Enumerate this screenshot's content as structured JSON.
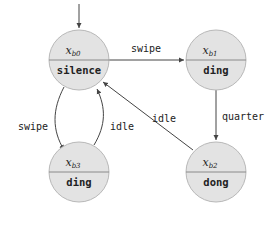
{
  "diagram": {
    "type": "state-machine",
    "initial_state": "xb0",
    "states": [
      {
        "id": "xb0",
        "var": "x",
        "sub": "b0",
        "output": "silence"
      },
      {
        "id": "xb1",
        "var": "x",
        "sub": "b1",
        "output": "ding"
      },
      {
        "id": "xb2",
        "var": "x",
        "sub": "b2",
        "output": "dong"
      },
      {
        "id": "xb3",
        "var": "x",
        "sub": "b3",
        "output": "ding"
      }
    ],
    "transitions": [
      {
        "from": "xb0",
        "to": "xb1",
        "label": "swipe"
      },
      {
        "from": "xb1",
        "to": "xb2",
        "label": "quarter"
      },
      {
        "from": "xb2",
        "to": "xb0",
        "label": "idle"
      },
      {
        "from": "xb0",
        "to": "xb3",
        "label": "swipe"
      },
      {
        "from": "xb3",
        "to": "xb0",
        "label": "idle"
      }
    ],
    "colors": {
      "state_fill": "#e3e3e3",
      "state_stroke": "#b8b8b8",
      "edge": "#444444"
    }
  }
}
